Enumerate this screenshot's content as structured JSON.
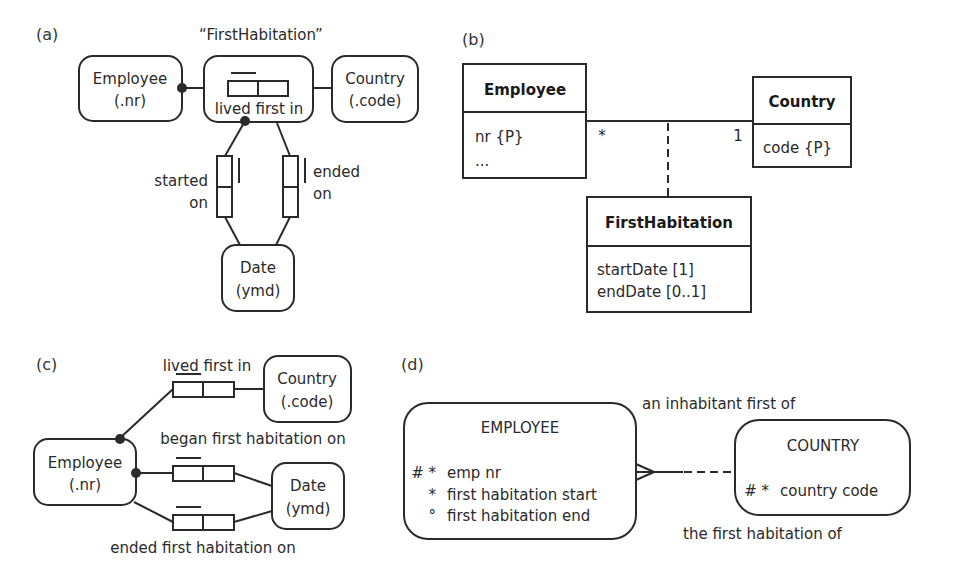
{
  "panels": {
    "a": {
      "label": "(a)",
      "objectified_name": "“FirstHabitation”",
      "employee": {
        "name": "Employee",
        "ref": "(.nr)"
      },
      "country": {
        "name": "Country",
        "ref": "(.code)"
      },
      "fact": {
        "reading": "lived first in"
      },
      "date": {
        "name": "Date",
        "ref": "(ymd)"
      },
      "started": {
        "line1": "started",
        "line2": "on"
      },
      "ended": {
        "line1": "ended",
        "line2": "on"
      }
    },
    "b": {
      "label": "(b)",
      "employee": {
        "name": "Employee",
        "attr1": "nr {P}",
        "attr2": "..."
      },
      "country": {
        "name": "Country",
        "attr1": "code {P}"
      },
      "association_class": {
        "name": "FirstHabitation",
        "attr1": "startDate [1]",
        "attr2": "endDate [0..1]"
      },
      "mult_employee": "*",
      "mult_country": "1"
    },
    "c": {
      "label": "(c)",
      "employee": {
        "name": "Employee",
        "ref": "(.nr)"
      },
      "country": {
        "name": "Country",
        "ref": "(.code)"
      },
      "date": {
        "name": "Date",
        "ref": "(ymd)"
      },
      "fact1": "lived first in",
      "fact2": "began first habitation on",
      "fact3": "ended first habitation on"
    },
    "d": {
      "label": "(d)",
      "employee": {
        "name": "EMPLOYEE",
        "attrs": [
          {
            "marker": "# *",
            "name": "emp nr"
          },
          {
            "marker": "*",
            "name": "first habitation start"
          },
          {
            "marker": "°",
            "name": "first habitation end"
          }
        ]
      },
      "country": {
        "name": "COUNTRY",
        "attrs": [
          {
            "marker": "# *",
            "name": "country code"
          }
        ]
      },
      "rel_top": "an inhabitant first of",
      "rel_bottom": "the first habitation of"
    }
  }
}
